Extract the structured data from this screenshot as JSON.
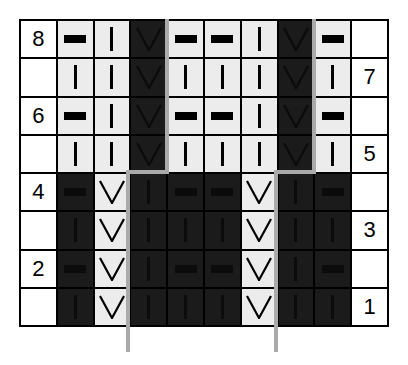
{
  "chart": {
    "title": "",
    "row_numbers_left": [
      "8",
      "",
      "6",
      "",
      "4",
      "",
      "2",
      ""
    ],
    "row_numbers_right": [
      "",
      "7",
      "",
      "5",
      "",
      "3",
      "",
      "1"
    ],
    "legend_symbols": {
      "-": "purl",
      "|": "knit",
      "V": "slip"
    },
    "colors": {
      "light_cell": "#ececec",
      "dark_cell": "#1b1b1b",
      "repeat_line": "#aaaaaa",
      "grid_line": "#000000"
    },
    "rows": [
      {
        "row": 8,
        "cells": [
          [
            "-",
            "light"
          ],
          [
            "|",
            "light"
          ],
          [
            "V",
            "dark"
          ],
          [
            "-",
            "light"
          ],
          [
            "-",
            "light"
          ],
          [
            "|",
            "light"
          ],
          [
            "V",
            "dark"
          ],
          [
            "-",
            "light"
          ]
        ]
      },
      {
        "row": 7,
        "cells": [
          [
            "|",
            "light"
          ],
          [
            "|",
            "light"
          ],
          [
            "V",
            "dark"
          ],
          [
            "|",
            "light"
          ],
          [
            "|",
            "light"
          ],
          [
            "|",
            "light"
          ],
          [
            "V",
            "dark"
          ],
          [
            "|",
            "light"
          ]
        ]
      },
      {
        "row": 6,
        "cells": [
          [
            "-",
            "light"
          ],
          [
            "|",
            "light"
          ],
          [
            "V",
            "dark"
          ],
          [
            "-",
            "light"
          ],
          [
            "-",
            "light"
          ],
          [
            "|",
            "light"
          ],
          [
            "V",
            "dark"
          ],
          [
            "-",
            "light"
          ]
        ]
      },
      {
        "row": 5,
        "cells": [
          [
            "|",
            "light"
          ],
          [
            "|",
            "light"
          ],
          [
            "V",
            "dark"
          ],
          [
            "|",
            "light"
          ],
          [
            "|",
            "light"
          ],
          [
            "|",
            "light"
          ],
          [
            "V",
            "dark"
          ],
          [
            "|",
            "light"
          ]
        ]
      },
      {
        "row": 4,
        "cells": [
          [
            "-",
            "dark"
          ],
          [
            "V",
            "light"
          ],
          [
            "|",
            "dark"
          ],
          [
            "-",
            "dark"
          ],
          [
            "-",
            "dark"
          ],
          [
            "V",
            "light"
          ],
          [
            "|",
            "dark"
          ],
          [
            "-",
            "dark"
          ]
        ]
      },
      {
        "row": 3,
        "cells": [
          [
            "|",
            "dark"
          ],
          [
            "V",
            "light"
          ],
          [
            "|",
            "dark"
          ],
          [
            "|",
            "dark"
          ],
          [
            "|",
            "dark"
          ],
          [
            "V",
            "light"
          ],
          [
            "|",
            "dark"
          ],
          [
            "|",
            "dark"
          ]
        ]
      },
      {
        "row": 2,
        "cells": [
          [
            "-",
            "dark"
          ],
          [
            "V",
            "light"
          ],
          [
            "|",
            "dark"
          ],
          [
            "-",
            "dark"
          ],
          [
            "-",
            "dark"
          ],
          [
            "V",
            "light"
          ],
          [
            "|",
            "dark"
          ],
          [
            "-",
            "dark"
          ]
        ]
      },
      {
        "row": 1,
        "cells": [
          [
            "|",
            "dark"
          ],
          [
            "V",
            "light"
          ],
          [
            "|",
            "dark"
          ],
          [
            "|",
            "dark"
          ],
          [
            "|",
            "dark"
          ],
          [
            "V",
            "light"
          ],
          [
            "|",
            "dark"
          ],
          [
            "|",
            "dark"
          ]
        ]
      }
    ],
    "repeat_lines": [
      {
        "name": "left",
        "segments": [
          [
            128,
            350,
            128,
            172
          ],
          [
            128,
            172,
            167,
            172
          ],
          [
            167,
            172,
            167,
            19
          ]
        ]
      },
      {
        "name": "right",
        "segments": [
          [
            276,
            350,
            276,
            172
          ],
          [
            276,
            172,
            314,
            172
          ],
          [
            314,
            172,
            314,
            19
          ]
        ]
      }
    ]
  }
}
